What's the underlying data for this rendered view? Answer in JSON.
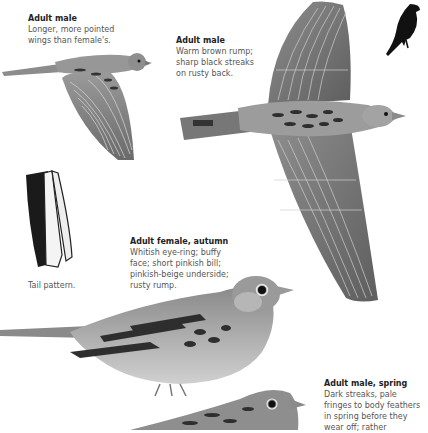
{
  "captions": [
    {
      "id": "adult-male-flight-side",
      "title": "Adult male",
      "body": "Longer, more pointed\nwings than female's."
    },
    {
      "id": "adult-male-flight-top",
      "title": "Adult male",
      "body": "Warm brown rump;\nsharp black streaks\non rusty back."
    },
    {
      "id": "adult-female-autumn",
      "title": "Adult female, autumn",
      "body": "Whitish eye-ring; buffy\nface; short pinkish bill;\npinkish-beige underside;\nrusty rump."
    },
    {
      "id": "adult-male-spring",
      "title": "Adult male, spring",
      "body": "Dark streaks, pale\nfringes to body feathers\nin spring before they\nwear off; rather"
    }
  ],
  "tail": {
    "label": "Tail pattern."
  },
  "illustrations": [
    {
      "name": "male-flight-side",
      "depicts": "bird in flight, side view"
    },
    {
      "name": "male-flight-top",
      "depicts": "bird in flight, top view, wings spread"
    },
    {
      "name": "silhouette",
      "depicts": "perched bird silhouette"
    },
    {
      "name": "tail",
      "depicts": "tail feathers"
    },
    {
      "name": "female-perched",
      "depicts": "perched female, side view"
    },
    {
      "name": "male-spring-perched",
      "depicts": "perched male head, partial"
    }
  ],
  "colors": {
    "background": "#ffffff",
    "title_text": "#222222",
    "body_text": "#555555",
    "plumage_mid": "#8a8a8a",
    "plumage_dark": "#3a3a3a",
    "plumage_light": "#c4c4c4"
  }
}
